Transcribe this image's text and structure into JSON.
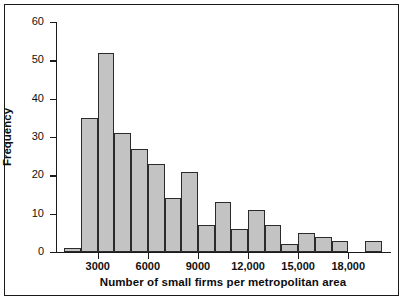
{
  "chart_data": {
    "type": "bar",
    "title": "",
    "subtitle": "",
    "xlabel": "Number of small firms per metropolitan area",
    "ylabel": "Frequency",
    "grid": false,
    "legend": false,
    "bin_width": 1000,
    "bin_starts": [
      1000,
      2000,
      3000,
      4000,
      5000,
      6000,
      7000,
      8000,
      9000,
      10000,
      11000,
      12000,
      13000,
      14000,
      15000,
      16000,
      17000,
      18000,
      19000
    ],
    "bin_labels": [
      "1000-2000",
      "2000-3000",
      "3000-4000",
      "4000-5000",
      "5000-6000",
      "6000-7000",
      "7000-8000",
      "8000-9000",
      "9000-10,000",
      "10,000-11,000",
      "11,000-12,000",
      "12,000-13,000",
      "13,000-14,000",
      "14,000-15,000",
      "15,000-16,000",
      "16,000-17,000",
      "17,000-18,000",
      "18,000-19,000",
      "19,000-20,000"
    ],
    "values": [
      1,
      35,
      52,
      31,
      27,
      23,
      14,
      21,
      7,
      13,
      6,
      11,
      7,
      2,
      5,
      4,
      3,
      0,
      3
    ],
    "xlim": [
      500,
      20500
    ],
    "ylim": [
      0,
      60
    ],
    "xticks": [
      3000,
      6000,
      9000,
      12000,
      15000,
      18000
    ],
    "xticklabels": [
      "3000",
      "6000",
      "9000",
      "12,000",
      "15,000",
      "18,000"
    ],
    "yticks": [
      0,
      10,
      20,
      30,
      40,
      50,
      60
    ],
    "yticklabels": [
      "0",
      "10",
      "20",
      "30",
      "40",
      "50",
      "60"
    ],
    "bar_color": "#c3c3c3",
    "bar_edge_color": "#2b2b2b",
    "axis_color": "#1a1a1a",
    "background": "#ffffff"
  }
}
